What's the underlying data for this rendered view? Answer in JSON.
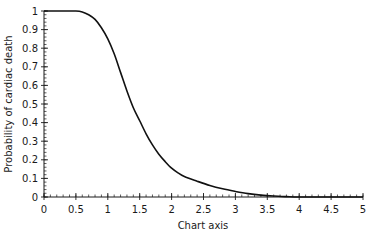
{
  "chart_data": {
    "type": "line",
    "title": "",
    "xlabel": "Chart axis",
    "ylabel": "Probability of cardiac death",
    "xlim": [
      0,
      5
    ],
    "ylim": [
      0,
      1
    ],
    "x_ticks": [
      "0",
      "0.5",
      "1",
      "1.5",
      "2",
      "2.5",
      "3",
      "3.5",
      "4",
      "4.5",
      "5"
    ],
    "y_ticks": [
      "0",
      "0.1",
      "0.2",
      "0.3",
      "0.4",
      "0.5",
      "0.6",
      "0.7",
      "0.8",
      "0.9",
      "1"
    ],
    "x_minor_step": 0.1,
    "y_minor_step": 0.02,
    "grid": false,
    "legend": null,
    "series": [
      {
        "name": "Probability of cardiac death",
        "color": "#111111",
        "x": [
          0,
          0.25,
          0.5,
          0.6,
          0.7,
          0.8,
          0.9,
          1.0,
          1.1,
          1.2,
          1.3,
          1.4,
          1.5,
          1.6,
          1.7,
          1.8,
          1.9,
          2.0,
          2.1,
          2.2,
          2.4,
          2.6,
          2.8,
          3.0,
          3.2,
          3.4,
          3.6,
          3.8,
          4.0,
          4.5,
          5.0
        ],
        "y": [
          1.0,
          1.0,
          1.0,
          0.995,
          0.98,
          0.955,
          0.91,
          0.85,
          0.77,
          0.67,
          0.57,
          0.48,
          0.41,
          0.34,
          0.28,
          0.23,
          0.19,
          0.155,
          0.13,
          0.11,
          0.085,
          0.062,
          0.044,
          0.03,
          0.018,
          0.01,
          0.005,
          0.002,
          0.0,
          0.0,
          0.0
        ]
      }
    ]
  }
}
